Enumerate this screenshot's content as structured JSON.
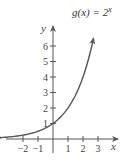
{
  "chart_data": {
    "type": "line",
    "function_label": {
      "prefix": "g(x) = 2",
      "exponent": "x"
    },
    "xlabel": "x",
    "ylabel": "y",
    "xlim": [
      -3,
      3.6
    ],
    "ylim": [
      0,
      7.2
    ],
    "x_ticks": [
      -2,
      -1,
      1,
      2,
      3
    ],
    "x_tick_labels": [
      "−2",
      "−1",
      "1",
      "2",
      "3"
    ],
    "y_ticks": [
      1,
      2,
      3,
      4,
      5,
      6
    ],
    "y_tick_labels": [
      "1",
      "2",
      "3",
      "4",
      "5",
      "6"
    ],
    "grid": false,
    "series": [
      {
        "name": "g(x) = 2^x",
        "x": [
          -3.4,
          -3,
          -2,
          -1,
          0,
          1,
          2,
          2.5,
          2.7
        ],
        "values": [
          0.095,
          0.125,
          0.25,
          0.5,
          1,
          2,
          4,
          5.66,
          6.5
        ],
        "color": "#555555",
        "arrows": "both"
      }
    ]
  },
  "colors": {
    "axis": "#555555",
    "curve": "#555555",
    "text": "#444444"
  }
}
